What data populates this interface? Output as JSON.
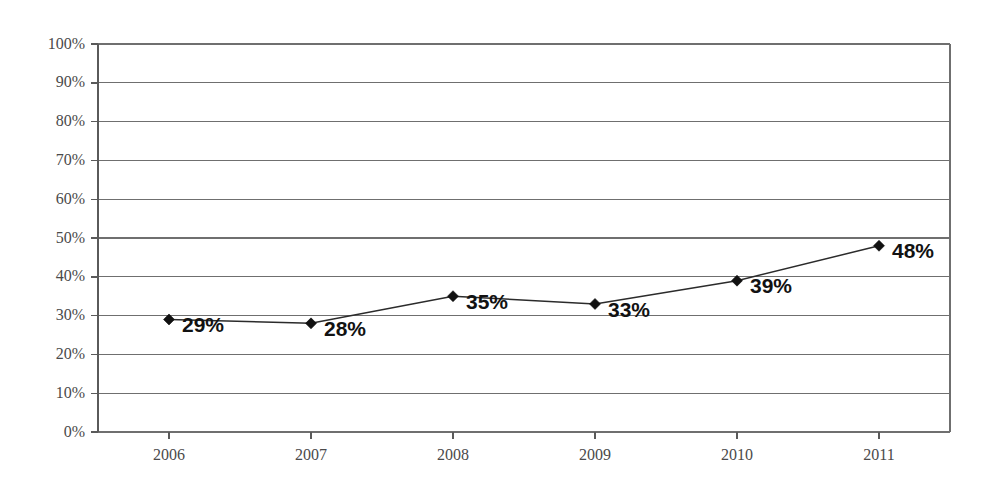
{
  "chart_data": {
    "type": "line",
    "title": "",
    "subtitle": "",
    "xlabel": "",
    "ylabel": "",
    "categories": [
      "2006",
      "2007",
      "2008",
      "2009",
      "2010",
      "2011"
    ],
    "values": [
      29,
      33,
      35,
      33,
      39,
      48
    ],
    "series": [
      {
        "name": "",
        "values": [
          29,
          28,
          35,
          33,
          39,
          48
        ],
        "point_labels": [
          "29%",
          "28%",
          "35%",
          "33%",
          "39%",
          "48%"
        ],
        "marker": "diamond",
        "marker_color": "#111111",
        "line_color": "#2b2b2b"
      }
    ],
    "ylim": [
      0,
      100
    ],
    "ytick_values": [
      0,
      10,
      20,
      30,
      40,
      50,
      60,
      70,
      80,
      90,
      100
    ],
    "ytick_labels": [
      "0%",
      "10%",
      "20%",
      "30%",
      "40%",
      "50%",
      "60%",
      "70%",
      "80%",
      "90%",
      "100%"
    ],
    "xtick_labels": [
      "2006",
      "2007",
      "2008",
      "2009",
      "2010",
      "2011"
    ],
    "grid": "horizontal",
    "legend": "none",
    "background_color": "#ffffff",
    "grid_color": "#6f6f6f",
    "axis_color": "#5a5a5a",
    "label_color": "#4a4a4a"
  },
  "geometry": {
    "plot_left": 98,
    "plot_right": 950,
    "plot_top": 44,
    "plot_bottom": 432,
    "first_point_x": 169,
    "point_spacing": 142,
    "tick_out": 7,
    "label_offset_x": 13
  }
}
